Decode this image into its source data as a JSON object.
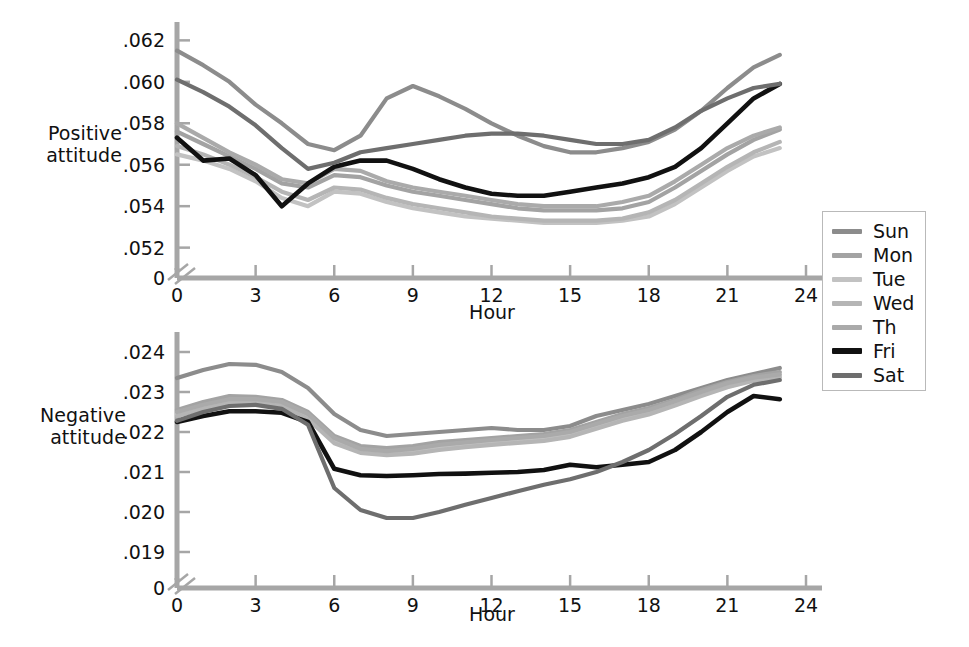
{
  "figure": {
    "legend": {
      "title": "",
      "position": "right",
      "entries": [
        {
          "label": "Sun",
          "color": "#8c8c8c"
        },
        {
          "label": "Mon",
          "color": "#a3a3a3"
        },
        {
          "label": "Tue",
          "color": "#c2c2c2"
        },
        {
          "label": "Wed",
          "color": "#b5b5b5"
        },
        {
          "label": "Th",
          "color": "#aaaaaa"
        },
        {
          "label": "Fri",
          "color": "#111111"
        },
        {
          "label": "Sat",
          "color": "#6e6e6e"
        }
      ]
    }
  },
  "chart_data": [
    {
      "id": "positive",
      "type": "line",
      "title": "",
      "xlabel": "Hour",
      "ylabel": "Positive\nattitude",
      "grid": false,
      "axis_break": true,
      "xlim": [
        0,
        24
      ],
      "ylim": [
        0.0515,
        0.0625
      ],
      "xticks": [
        0,
        3,
        6,
        9,
        12,
        15,
        18,
        21,
        24
      ],
      "xticklabels": [
        "0",
        "3",
        "6",
        "9",
        "12",
        "15",
        "18",
        "21",
        "24"
      ],
      "yticks": [
        0.052,
        0.054,
        0.056,
        0.058,
        0.06,
        0.062
      ],
      "yticklabels": [
        ".052",
        ".054",
        ".056",
        ".058",
        ".060",
        ".062"
      ],
      "y_origin_label": "0",
      "x": [
        0,
        1,
        2,
        3,
        4,
        5,
        6,
        7,
        8,
        9,
        10,
        11,
        12,
        13,
        14,
        15,
        16,
        17,
        18,
        19,
        20,
        21,
        22,
        23
      ],
      "series": [
        {
          "name": "Sun",
          "color": "#8c8c8c",
          "values": [
            0.0615,
            0.0608,
            0.06,
            0.0589,
            0.058,
            0.057,
            0.0567,
            0.0574,
            0.0592,
            0.0598,
            0.0593,
            0.0587,
            0.058,
            0.0574,
            0.0569,
            0.0566,
            0.0566,
            0.0568,
            0.0571,
            0.0577,
            0.0586,
            0.0597,
            0.0607,
            0.0613
          ]
        },
        {
          "name": "Mon",
          "color": "#a3a3a3",
          "values": [
            0.0576,
            0.057,
            0.0564,
            0.0558,
            0.0551,
            0.0549,
            0.0555,
            0.0554,
            0.055,
            0.0547,
            0.0545,
            0.0543,
            0.0541,
            0.0539,
            0.0538,
            0.0538,
            0.0538,
            0.0539,
            0.0542,
            0.0549,
            0.0557,
            0.0565,
            0.0572,
            0.0577
          ]
        },
        {
          "name": "Tue",
          "color": "#c2c2c2",
          "values": [
            0.0565,
            0.0562,
            0.0558,
            0.0552,
            0.0544,
            0.054,
            0.0547,
            0.0546,
            0.0542,
            0.0539,
            0.0537,
            0.0535,
            0.0534,
            0.0533,
            0.0532,
            0.0532,
            0.0532,
            0.0533,
            0.0535,
            0.0541,
            0.0549,
            0.0557,
            0.0564,
            0.0568
          ]
        },
        {
          "name": "Wed",
          "color": "#b5b5b5",
          "values": [
            0.0569,
            0.0565,
            0.056,
            0.0554,
            0.0547,
            0.0543,
            0.0549,
            0.0548,
            0.0544,
            0.0541,
            0.0539,
            0.0537,
            0.0535,
            0.0534,
            0.0533,
            0.0533,
            0.0533,
            0.0534,
            0.0537,
            0.0543,
            0.0551,
            0.0559,
            0.0566,
            0.0571
          ]
        },
        {
          "name": "Th",
          "color": "#aaaaaa",
          "values": [
            0.058,
            0.0573,
            0.0566,
            0.056,
            0.0553,
            0.0551,
            0.0558,
            0.0557,
            0.0552,
            0.0549,
            0.0547,
            0.0545,
            0.0543,
            0.0541,
            0.054,
            0.054,
            0.054,
            0.0542,
            0.0545,
            0.0552,
            0.056,
            0.0568,
            0.0574,
            0.0578
          ]
        },
        {
          "name": "Fri",
          "color": "#111111",
          "values": [
            0.0573,
            0.0562,
            0.0563,
            0.0555,
            0.054,
            0.0551,
            0.0559,
            0.0562,
            0.0562,
            0.0558,
            0.0553,
            0.0549,
            0.0546,
            0.0545,
            0.0545,
            0.0547,
            0.0549,
            0.0551,
            0.0554,
            0.0559,
            0.0568,
            0.058,
            0.0592,
            0.0599
          ]
        },
        {
          "name": "Sat",
          "color": "#6e6e6e",
          "values": [
            0.0601,
            0.0595,
            0.0588,
            0.0579,
            0.0568,
            0.0558,
            0.0561,
            0.0566,
            0.0568,
            0.057,
            0.0572,
            0.0574,
            0.0575,
            0.0575,
            0.0574,
            0.0572,
            0.057,
            0.057,
            0.0572,
            0.0578,
            0.0586,
            0.0592,
            0.0597,
            0.0599
          ]
        }
      ]
    },
    {
      "id": "negative",
      "type": "line",
      "title": "",
      "xlabel": "Hour",
      "ylabel": "Negative\nattitude",
      "grid": false,
      "axis_break": true,
      "xlim": [
        0,
        24
      ],
      "ylim": [
        0.0186,
        0.0243
      ],
      "xticks": [
        0,
        3,
        6,
        9,
        12,
        15,
        18,
        21,
        24
      ],
      "xticklabels": [
        "0",
        "3",
        "6",
        "9",
        "12",
        "15",
        "18",
        "21",
        "24"
      ],
      "yticks": [
        0.019,
        0.02,
        0.021,
        0.022,
        0.023,
        0.024
      ],
      "yticklabels": [
        ".019",
        ".020",
        ".021",
        ".022",
        ".023",
        ".024"
      ],
      "y_origin_label": "0",
      "x": [
        0,
        1,
        2,
        3,
        4,
        5,
        6,
        7,
        8,
        9,
        10,
        11,
        12,
        13,
        14,
        15,
        16,
        17,
        18,
        19,
        20,
        21,
        22,
        23
      ],
      "series": [
        {
          "name": "Sun",
          "color": "#8c8c8c",
          "values": [
            0.02335,
            0.02355,
            0.0237,
            0.02368,
            0.0235,
            0.0231,
            0.02245,
            0.02205,
            0.0219,
            0.02195,
            0.022,
            0.02205,
            0.0221,
            0.02205,
            0.02205,
            0.02215,
            0.0224,
            0.02255,
            0.0227,
            0.0229,
            0.0231,
            0.0233,
            0.02345,
            0.0236
          ]
        },
        {
          "name": "Mon",
          "color": "#a3a3a3",
          "values": [
            0.02255,
            0.02275,
            0.0229,
            0.02288,
            0.0228,
            0.0225,
            0.0219,
            0.02165,
            0.0216,
            0.02165,
            0.02175,
            0.0218,
            0.02185,
            0.0219,
            0.02195,
            0.02205,
            0.02225,
            0.02245,
            0.0226,
            0.0228,
            0.02305,
            0.02325,
            0.0234,
            0.0235
          ]
        },
        {
          "name": "Tue",
          "color": "#c2c2c2",
          "values": [
            0.02245,
            0.02265,
            0.02278,
            0.02278,
            0.0227,
            0.0224,
            0.0218,
            0.02155,
            0.0215,
            0.02155,
            0.02163,
            0.0217,
            0.02175,
            0.0218,
            0.02185,
            0.02195,
            0.02215,
            0.02235,
            0.0225,
            0.02272,
            0.02296,
            0.02318,
            0.02332,
            0.0234
          ]
        },
        {
          "name": "Wed",
          "color": "#b5b5b5",
          "values": [
            0.0224,
            0.02258,
            0.02272,
            0.02272,
            0.02265,
            0.02232,
            0.02172,
            0.02148,
            0.02142,
            0.02146,
            0.02155,
            0.02162,
            0.02168,
            0.02173,
            0.02178,
            0.02188,
            0.02208,
            0.02228,
            0.02244,
            0.02266,
            0.0229,
            0.02312,
            0.02328,
            0.02336
          ]
        },
        {
          "name": "Th",
          "color": "#aaaaaa",
          "values": [
            0.0225,
            0.02268,
            0.02282,
            0.02282,
            0.02275,
            0.02245,
            0.02185,
            0.02158,
            0.02152,
            0.02158,
            0.02168,
            0.02174,
            0.0218,
            0.02185,
            0.0219,
            0.022,
            0.0222,
            0.0224,
            0.02255,
            0.02277,
            0.023,
            0.02322,
            0.02336,
            0.02344
          ]
        },
        {
          "name": "Fri",
          "color": "#111111",
          "values": [
            0.02225,
            0.0224,
            0.02252,
            0.02252,
            0.02248,
            0.02225,
            0.02108,
            0.02092,
            0.0209,
            0.02092,
            0.02095,
            0.02096,
            0.02098,
            0.021,
            0.02105,
            0.02118,
            0.02112,
            0.02118,
            0.02125,
            0.02155,
            0.022,
            0.0225,
            0.0229,
            0.02282
          ]
        },
        {
          "name": "Sat",
          "color": "#6e6e6e",
          "values": [
            0.02228,
            0.0225,
            0.02265,
            0.02268,
            0.02258,
            0.02218,
            0.0206,
            0.02005,
            0.01985,
            0.01985,
            0.02,
            0.02018,
            0.02035,
            0.02052,
            0.02068,
            0.02082,
            0.021,
            0.02125,
            0.02155,
            0.02195,
            0.0224,
            0.02288,
            0.02318,
            0.0233
          ]
        }
      ]
    }
  ]
}
